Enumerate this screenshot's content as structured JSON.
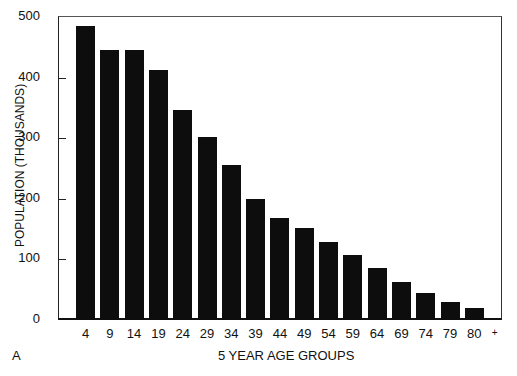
{
  "chart_data": {
    "type": "bar",
    "title": "",
    "panel_label": "A",
    "xlabel": "5 YEAR AGE GROUPS",
    "ylabel": "POPULATION (THOUSANDS)",
    "categories": [
      "4",
      "9",
      "14",
      "19",
      "24",
      "29",
      "34",
      "39",
      "44",
      "49",
      "54",
      "59",
      "64",
      "69",
      "74",
      "79",
      "80"
    ],
    "last_category_suffix": "+",
    "values": [
      485,
      445,
      445,
      412,
      347,
      302,
      255,
      200,
      168,
      152,
      129,
      108,
      85,
      63,
      45,
      29,
      20
    ],
    "yticks": [
      0,
      100,
      200,
      300,
      400,
      500
    ],
    "ylim": [
      0,
      500
    ],
    "grid": false,
    "legend": null,
    "bar_color": "#0d0d0d"
  }
}
